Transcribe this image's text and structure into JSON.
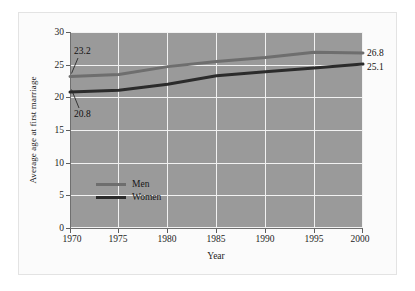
{
  "chart_data": {
    "type": "line",
    "title": "",
    "xlabel": "Year",
    "ylabel": "Average age at first marriage",
    "x": [
      1970,
      1975,
      1980,
      1985,
      1990,
      1995,
      2000
    ],
    "xlim": [
      1970,
      2000
    ],
    "ylim": [
      0,
      30
    ],
    "xticks": [
      "1970",
      "1975",
      "1980",
      "1985",
      "1990",
      "1995",
      "2000"
    ],
    "yticks": [
      "0",
      "5",
      "10",
      "15",
      "20",
      "25",
      "30"
    ],
    "grid": true,
    "legend_position": "inside-lower-left",
    "series": [
      {
        "name": "Men",
        "color": "#6e6e6e",
        "values": [
          23.2,
          23.5,
          24.7,
          25.5,
          26.1,
          26.9,
          26.8
        ]
      },
      {
        "name": "Women",
        "color": "#2b2b2b",
        "values": [
          20.8,
          21.1,
          22.0,
          23.3,
          23.9,
          24.5,
          25.1
        ]
      }
    ],
    "annotations": [
      {
        "text": "23.2",
        "series": "Men",
        "x": 1970,
        "y": 23.2,
        "position": "upper-left"
      },
      {
        "text": "20.8",
        "series": "Women",
        "x": 1970,
        "y": 20.8,
        "position": "lower-left"
      },
      {
        "text": "26.8",
        "series": "Men",
        "x": 2000,
        "y": 26.8,
        "position": "right"
      },
      {
        "text": "25.1",
        "series": "Women",
        "x": 2000,
        "y": 25.1,
        "position": "right"
      }
    ],
    "plot_background": "#9a9a9a",
    "gridline_color": "#f2f2f2"
  },
  "axes": {
    "y_title": "Average age at first marriage",
    "x_title": "Year",
    "y_ticks": [
      "30",
      "25",
      "20",
      "15",
      "10",
      "5",
      "0"
    ],
    "x_ticks": [
      "1970",
      "1975",
      "1980",
      "1985",
      "1990",
      "1995",
      "2000"
    ]
  },
  "legend": {
    "entries": [
      {
        "label": "Men",
        "color": "#6e6e6e"
      },
      {
        "label": "Women",
        "color": "#2b2b2b"
      }
    ]
  },
  "annotations": {
    "men_start": "23.2",
    "women_start": "20.8",
    "men_end": "26.8",
    "women_end": "25.1"
  }
}
